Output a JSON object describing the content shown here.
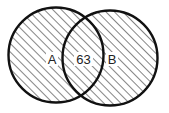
{
  "diagram": {
    "type": "venn",
    "sets": [
      {
        "id": "A",
        "label": "A"
      },
      {
        "id": "B",
        "label": "B"
      }
    ],
    "intersection": {
      "label": "63",
      "value": 63
    },
    "style": {
      "stroke": "#111111",
      "hatch": "#333333",
      "background": "#ffffff"
    }
  }
}
